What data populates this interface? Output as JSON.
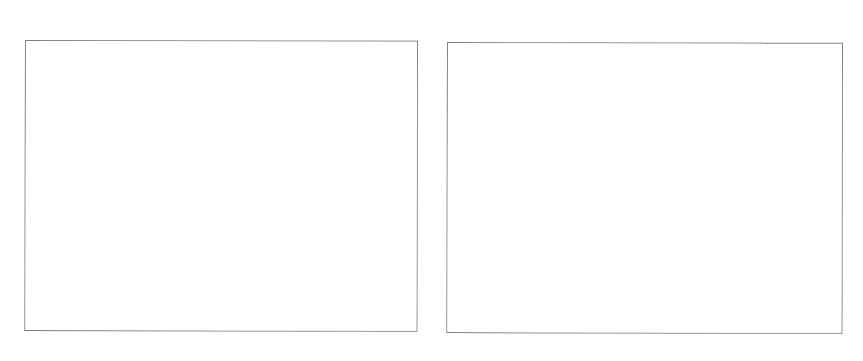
{
  "page": {
    "background_color": "#ffffff",
    "width": 863,
    "height": 361
  },
  "figures": [
    {
      "name": "left-figure-frame",
      "content": "",
      "caption": "",
      "border_color": "#808080",
      "fill_color": "#ffffff",
      "x": 25,
      "y": 40,
      "width": 393,
      "height": 291
    },
    {
      "name": "right-figure-frame",
      "content": "",
      "caption": "",
      "border_color": "#808080",
      "fill_color": "#ffffff",
      "x": 447,
      "y": 42,
      "width": 396,
      "height": 291
    }
  ],
  "chart_data": {
    "type": "table",
    "title": "",
    "subtitle": "",
    "xlabel": "",
    "ylabel": "",
    "categories": [],
    "values": [],
    "annotations": [],
    "legend": [],
    "grid": false,
    "note": "Both plot areas are blank in the source image; no data points, axes, ticks, or legend are rendered."
  }
}
